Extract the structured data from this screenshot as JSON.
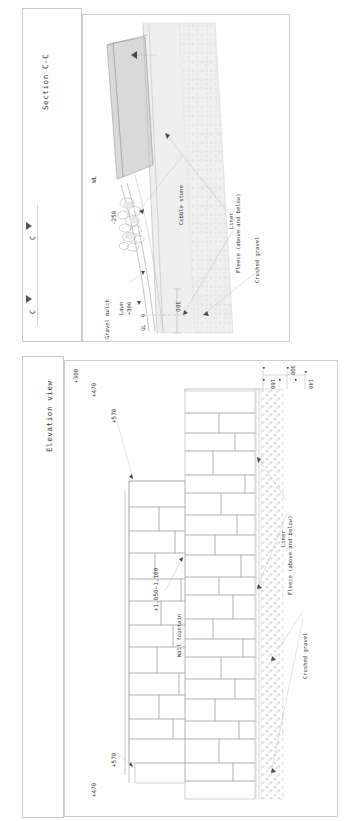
{
  "drawing": {
    "sheet_background": "#ffffff",
    "line_color": "#8a8a8a"
  },
  "section_panel": {
    "title": "Section C-C",
    "marker_left_label": "C",
    "marker_right_label": "C",
    "labels": {
      "water_level": "WL",
      "water_depth": "-250",
      "gravel_mulch": "Gravel mulch",
      "lawn": "Lawn",
      "lawn_level": "+300",
      "ground_level": "GL",
      "ground_level_value": "0",
      "depth_dim": "300",
      "cobble_stone": "Cobble stone",
      "liner": "Liner",
      "fleece": "Fleece  (above and below)",
      "crushed_gravel": "Crushed gravel"
    }
  },
  "elevation_panel": {
    "title": "Elevation view",
    "labels": {
      "wall_fountain": "Wall fountain",
      "wall_height": "+1,050~1,100",
      "level_570_left": "+570",
      "level_470_left": "+470",
      "level_570_right": "+570",
      "level_470_right": "+470",
      "level_300": "+300",
      "dim_300": "300",
      "dim_160": "160",
      "dim_140": "140",
      "liner": "Liner",
      "fleece": "Fleece  (above and below)",
      "crushed_gravel": "Crushed gravel"
    }
  }
}
